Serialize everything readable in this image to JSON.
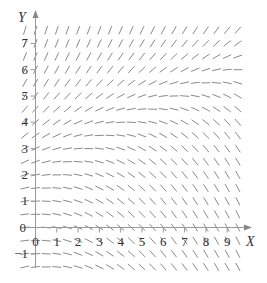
{
  "chart_data": {
    "type": "slope_field",
    "title": "",
    "xlabel": "X",
    "ylabel": "Y",
    "x_ticks": [
      "0",
      "1",
      "2",
      "3",
      "4",
      "5",
      "6",
      "7",
      "8",
      "9"
    ],
    "y_ticks": [
      "-1",
      "0",
      "1",
      "2",
      "3",
      "4",
      "5",
      "6",
      "7"
    ],
    "xlim": [
      -0.5,
      9.8
    ],
    "ylim": [
      -1.8,
      7.8
    ],
    "grid": false,
    "legend": null,
    "field": {
      "x_start": -0.5,
      "x_end": 9.5,
      "x_step": 0.5,
      "y_start": -1.5,
      "y_end": 7.5,
      "y_step": 0.5,
      "slope_model": "dy/dx ≈ 0.045*y^2 - 0.17*x",
      "coef_y2": 0.045,
      "coef_x": -0.17,
      "segment_length_px": 9
    },
    "colors": {
      "axis": "#999999",
      "segment": "#8a8a8a",
      "text": "#333333"
    }
  }
}
